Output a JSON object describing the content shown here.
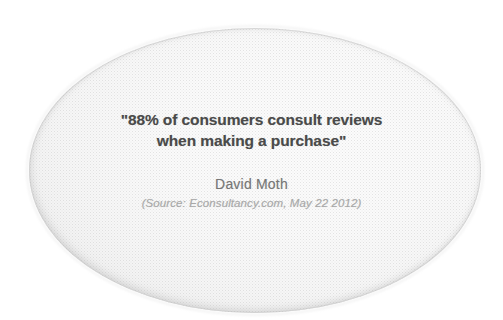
{
  "card": {
    "shape": "ellipse",
    "background_color": "#ffffff",
    "ellipse_fill_color": "#fafafa",
    "ellipse_edge_color": "#cdcdcd"
  },
  "quote": {
    "lines": [
      "\"88% of consumers consult reviews",
      "when making a purchase\""
    ],
    "text_color": "#4a4a4a",
    "statistic": "88%"
  },
  "attribution": {
    "author": "David Moth",
    "author_color": "#767676",
    "source": "(Source: Econsultancy.com, May 22 2012)",
    "source_color": "#a8a8a8",
    "source_publication": "Econsultancy.com",
    "source_date": "May 22 2012"
  }
}
